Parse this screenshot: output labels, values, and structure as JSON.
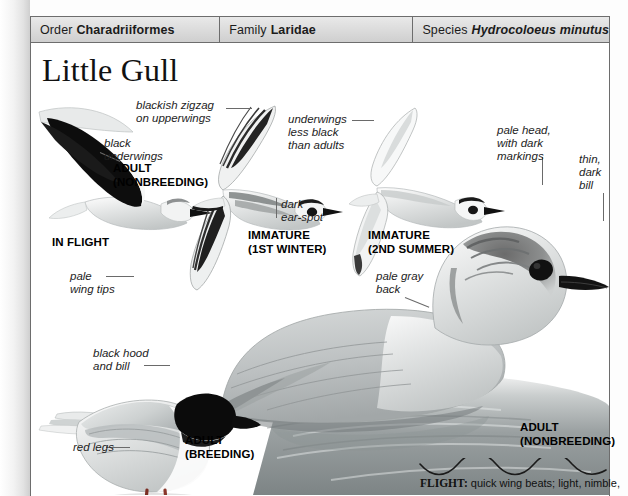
{
  "page": {
    "title": "Little Gull",
    "taxonomy": [
      {
        "label": "Order",
        "value": "Charadriiformes",
        "italic": false
      },
      {
        "label": "Family",
        "value": "Laridae",
        "italic": false
      },
      {
        "label": "Species",
        "value": "Hydrocoloeus minutus",
        "italic": true
      }
    ]
  },
  "callouts": {
    "blackish_zigzag": "blackish zigzag\non upperwings",
    "black_underwings": "black\nunderwings",
    "underwings_less_black": "underwings\nless black\nthan adults",
    "dark_ear_spot": "dark\near-spot",
    "pale_head": "pale head,\nwith dark\nmarkings",
    "thin_dark_bill": "thin,\ndark\nbill",
    "pale_wing_tips": "pale\nwing tips",
    "pale_gray_back": "pale gray\nback",
    "black_hood_and_bill": "black hood\nand bill",
    "red_legs": "red legs"
  },
  "captions": {
    "in_flight": "IN FLIGHT",
    "adult_nonbreeding_flight": "ADULT\n(NONBREEDING)",
    "immature_1st_winter": "IMMATURE\n(1ST WINTER)",
    "immature_2nd_summer": "IMMATURE\n(2ND SUMMER)",
    "adult_nonbreeding_swimming": "ADULT\n(NONBREEDING)",
    "adult_breeding": "ADULT\n(BREEDING)"
  },
  "flight": {
    "label": "FLIGHT:",
    "text": "quick wing beats; light, nimble,"
  },
  "colors": {
    "header_bar": "#dcdcdc",
    "rule": "#6d6d6d",
    "text": "#1b1b1b",
    "leader": "#6a6a6a"
  }
}
